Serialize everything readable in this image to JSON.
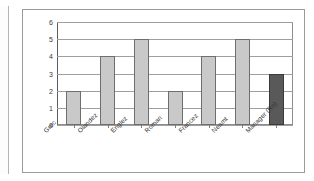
{
  "chart_data": {
    "type": "bar",
    "title": "",
    "subtitle": "",
    "xlabel": "",
    "ylabel": "",
    "categories": [
      "Grec",
      "Olandez",
      "Englez",
      "Roman",
      "Francez",
      "Neamt",
      "Manager (Ro)"
    ],
    "values": [
      2,
      4,
      5,
      2,
      4,
      5,
      3
    ],
    "ylim": [
      0,
      6
    ],
    "yticks": [
      "0",
      "1",
      "2",
      "3",
      "4",
      "5",
      "6"
    ],
    "ytick_values": [
      0,
      1,
      2,
      3,
      4,
      5,
      6
    ],
    "grid": true,
    "legend": "none",
    "series": [
      {
        "name": "",
        "values": [
          2,
          4,
          5,
          2,
          4,
          5,
          3
        ],
        "bar_styles": [
          "light",
          "light",
          "light",
          "light",
          "light",
          "light",
          "dark"
        ]
      }
    ],
    "colors": {
      "bar_light": "#c9c9c9",
      "bar_dark": "#595959",
      "bar_border": "#6e6e6e",
      "gridline": "#9f9f9f",
      "axis": "#5d5d5d",
      "frame": "#9a9a9a",
      "text": "#2f2f2f",
      "background": "#ffffff"
    }
  }
}
